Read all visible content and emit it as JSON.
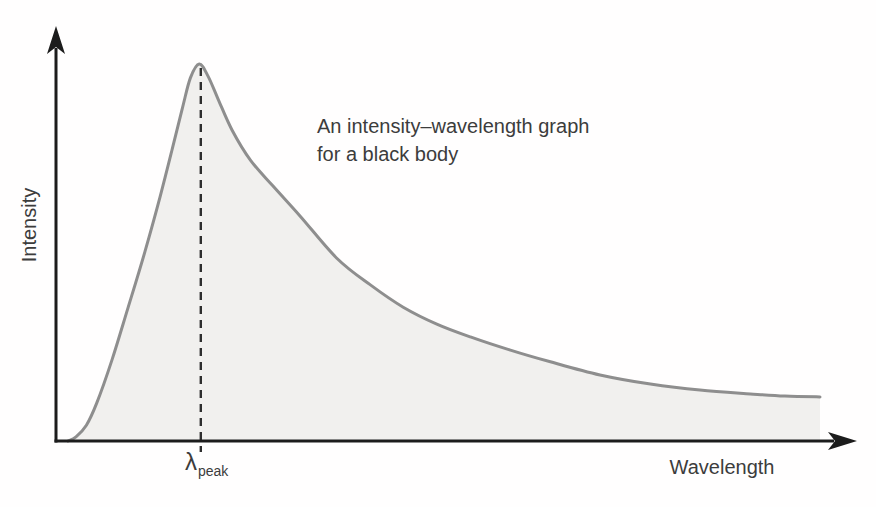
{
  "figure": {
    "background": "#fffefe"
  },
  "annotation": {
    "line1": "An intensity–wavelength graph",
    "line2": "for a black body"
  },
  "peak_label": {
    "symbol": "λ",
    "subscript": "peak"
  },
  "chart_data": {
    "type": "area",
    "title": "An intensity–wavelength graph for a black body",
    "xlabel": "Wavelength",
    "ylabel": "Intensity",
    "axes_numeric": false,
    "grid": false,
    "legend": "none",
    "x_range_normalized": [
      0,
      1
    ],
    "y_range_normalized": [
      0,
      1
    ],
    "series": [
      {
        "name": "black-body intensity spectrum",
        "points": [
          [
            0.015,
            0.0
          ],
          [
            0.025,
            0.011
          ],
          [
            0.038,
            0.042
          ],
          [
            0.051,
            0.101
          ],
          [
            0.07,
            0.215
          ],
          [
            0.09,
            0.353
          ],
          [
            0.111,
            0.501
          ],
          [
            0.13,
            0.647
          ],
          [
            0.145,
            0.772
          ],
          [
            0.158,
            0.883
          ],
          [
            0.168,
            0.963
          ],
          [
            0.179,
            1.0
          ],
          [
            0.19,
            0.968
          ],
          [
            0.203,
            0.905
          ],
          [
            0.22,
            0.825
          ],
          [
            0.243,
            0.745
          ],
          [
            0.271,
            0.677
          ],
          [
            0.305,
            0.597
          ],
          [
            0.351,
            0.485
          ],
          [
            0.393,
            0.414
          ],
          [
            0.434,
            0.355
          ],
          [
            0.476,
            0.31
          ],
          [
            0.518,
            0.276
          ],
          [
            0.568,
            0.241
          ],
          [
            0.618,
            0.21
          ],
          [
            0.68,
            0.175
          ],
          [
            0.743,
            0.151
          ],
          [
            0.805,
            0.135
          ],
          [
            0.868,
            0.125
          ],
          [
            0.911,
            0.119
          ],
          [
            0.955,
            0.117
          ]
        ]
      }
    ],
    "peak": {
      "x": 0.181,
      "y": 1.0,
      "label": "λpeak",
      "marker": "dashed-vertical-line"
    },
    "colors": {
      "curve": "#8e8e8e",
      "fill": "#f1f0ee",
      "axis": "#1c1c1c",
      "dash": "#2e2e2e",
      "text": "#3c3c3c"
    }
  }
}
